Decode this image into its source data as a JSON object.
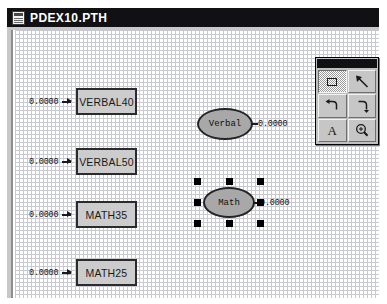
{
  "window": {
    "title": "PDEX10.PTH",
    "icon": "document-icon"
  },
  "palette": {
    "title": "",
    "tools": [
      {
        "name": "select-tool",
        "glyph": "rectangle-select-icon",
        "active": true,
        "label": "Select"
      },
      {
        "name": "arrow-tool",
        "glyph": "arrow-diagonal-icon",
        "active": false,
        "label": "Arrow"
      },
      {
        "name": "curve-left-tool",
        "glyph": "curve-left-icon",
        "active": false,
        "label": "Curve Left"
      },
      {
        "name": "curve-right-tool",
        "glyph": "curve-right-icon",
        "active": false,
        "label": "Curve Right"
      },
      {
        "name": "text-tool",
        "glyph": "text-A-icon",
        "active": false,
        "label": "A"
      },
      {
        "name": "zoom-tool",
        "glyph": "magnifier-plus-icon",
        "active": false,
        "label": "Zoom"
      }
    ]
  },
  "diagram": {
    "observed": [
      {
        "label": "VERBAL40",
        "error": "0.0000",
        "x": 61,
        "y": 58,
        "w": 61,
        "h": 27
      },
      {
        "label": "VERBAL50",
        "error": "0.0000",
        "x": 61,
        "y": 118,
        "w": 61,
        "h": 27
      },
      {
        "label": "MATH35",
        "error": "0.0000",
        "x": 61,
        "y": 171,
        "w": 61,
        "h": 27
      },
      {
        "label": "MATH25",
        "error": "0.0000",
        "x": 61,
        "y": 229,
        "w": 61,
        "h": 27
      }
    ],
    "latents": [
      {
        "label": "Verbal",
        "value": "0.0000",
        "x": 182,
        "y": 78,
        "w": 56,
        "h": 32,
        "selected": false
      },
      {
        "label": "Math",
        "value": "0.0000",
        "x": 188,
        "y": 157,
        "w": 52,
        "h": 31,
        "selected": true
      }
    ]
  },
  "colors": {
    "titlebar": "#111114",
    "box_fill": "#cccccc",
    "ellipse_fill": "#a8a8a8",
    "outline": "#242424",
    "grid": "#c9c9d2",
    "palette_face": "#c0c0c0"
  }
}
